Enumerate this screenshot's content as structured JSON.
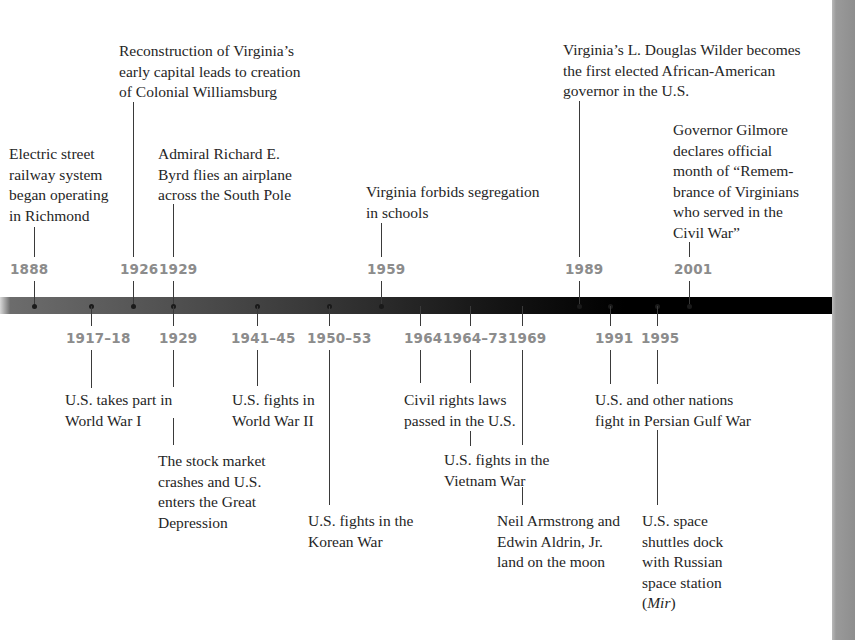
{
  "colors": {
    "bar": "#000000",
    "year_label": "#8c8c8c",
    "text": "#252525",
    "gutter": "#9a9a9a"
  },
  "above": [
    {
      "year": "1888",
      "text": "Electric street\nrailway system\nbegan operating\nin Richmond"
    },
    {
      "year": "1926",
      "text": "Reconstruction of Virginia’s\nearly capital leads to creation\nof Colonial Williamsburg"
    },
    {
      "year": "1929",
      "text": "Admiral Richard E.\nByrd flies an airplane\nacross the South Pole"
    },
    {
      "year": "1959",
      "text": "Virginia forbids segregation\nin schools"
    },
    {
      "year": "1989",
      "text": "Virginia’s L. Douglas Wilder becomes\nthe first elected African-American\ngovernor in the U.S."
    },
    {
      "year": "2001",
      "text": "Governor Gilmore\ndeclares official\nmonth of “Remem-\nbrance of Virginians\nwho served in the\nCivil War”"
    }
  ],
  "below": [
    {
      "year": "1917–18",
      "text": "U.S. takes part in\nWorld War I"
    },
    {
      "year": "1929",
      "text": "The stock market\ncrashes and U.S.\nenters the Great\nDepression"
    },
    {
      "year": "1941–45",
      "text": "U.S. fights in\nWorld War II"
    },
    {
      "year": "1950–53",
      "text": "U.S. fights in the\nKorean War"
    },
    {
      "year": "1964",
      "text": "Civil rights laws\npassed in the U.S."
    },
    {
      "year": "1964–73",
      "text": "U.S. fights in the\nVietnam War"
    },
    {
      "year": "1969",
      "text": "Neil Armstrong and\nEdwin Aldrin, Jr.\nland on the moon"
    },
    {
      "year": "1991",
      "text": "U.S. and other nations\nfight in Persian Gulf War"
    },
    {
      "year": "1995",
      "text": "U.S. space\nshuttles dock\nwith Russian\nspace station",
      "italic_suffix_pre": "(",
      "italic_word": "Mir",
      "italic_suffix_post": ")"
    }
  ]
}
